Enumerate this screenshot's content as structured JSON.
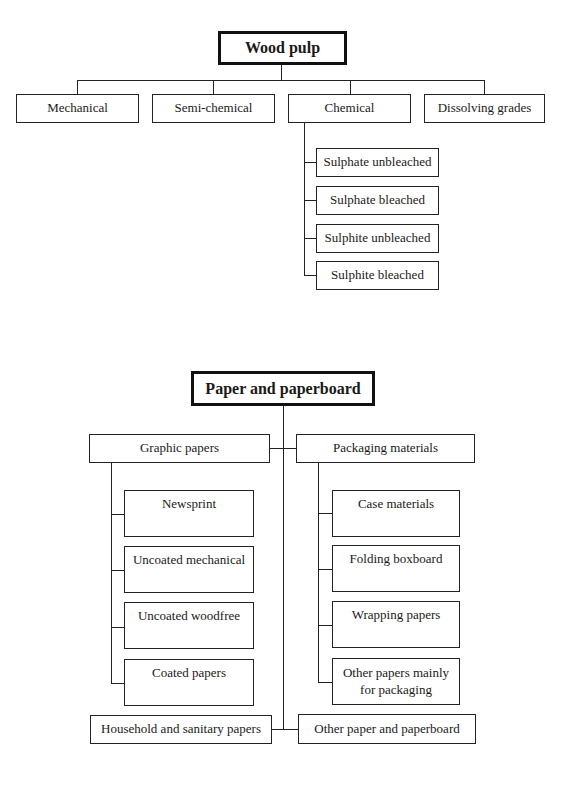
{
  "wood_pulp": {
    "title": "Wood pulp",
    "categories": [
      "Mechanical",
      "Semi-chemical",
      "Chemical",
      "Dissolving grades"
    ],
    "chemical_subtypes": [
      "Sulphate unbleached",
      "Sulphate bleached",
      "Sulphite unbleached",
      "Sulphite bleached"
    ]
  },
  "paper": {
    "title": "Paper and paperboard",
    "graphic": {
      "label": "Graphic papers",
      "items": [
        "Newsprint",
        "Uncoated mechanical",
        "Uncoated woodfree",
        "Coated papers"
      ]
    },
    "packaging": {
      "label": "Packaging materials",
      "items": [
        "Case materials",
        "Folding boxboard",
        "Wrapping papers",
        "Other papers mainly for packaging"
      ]
    },
    "household": "Household and sanitary papers",
    "other": "Other paper and paperboard"
  }
}
